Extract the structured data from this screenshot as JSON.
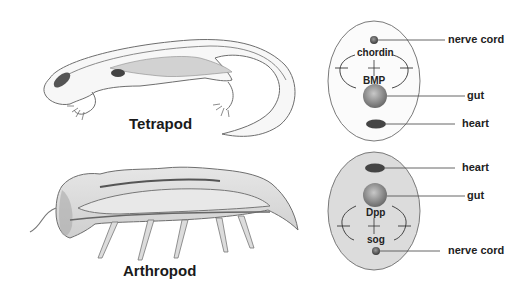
{
  "figure": {
    "panels": [
      {
        "organism": "Tetrapod",
        "cross_section": {
          "top_to_bottom": [
            "nerve cord",
            "gut",
            "heart"
          ],
          "upper_molecule": "chordin",
          "lower_molecule": "BMP",
          "labels": {
            "nerve_cord": "nerve cord",
            "gut": "gut",
            "heart": "heart"
          }
        }
      },
      {
        "organism": "Arthropod",
        "cross_section": {
          "top_to_bottom": [
            "heart",
            "gut",
            "nerve cord"
          ],
          "upper_molecule": "Dpp",
          "lower_molecule": "sog",
          "labels": {
            "heart": "heart",
            "gut": "gut",
            "nerve_cord": "nerve cord"
          }
        }
      }
    ]
  },
  "colors": {
    "outline": "#6e6e6e",
    "organ_dark": "#444444",
    "gut": "#8a8a8a",
    "arthropod_fill": "#dcdcdc",
    "text": "#1a1a1a"
  }
}
